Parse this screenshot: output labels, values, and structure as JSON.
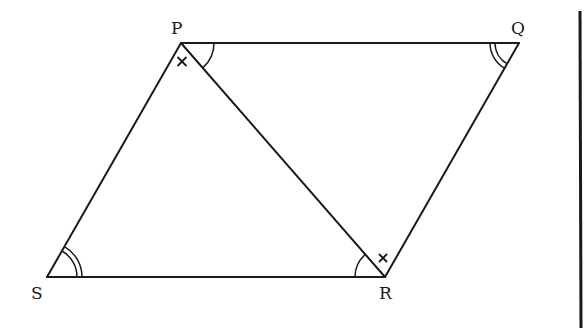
{
  "diagram": {
    "vertices": {
      "P": {
        "label": "P",
        "x": 181,
        "y": 43
      },
      "Q": {
        "label": "Q",
        "x": 519,
        "y": 43
      },
      "R": {
        "label": "R",
        "x": 385,
        "y": 277
      },
      "S": {
        "label": "S",
        "x": 47,
        "y": 277
      }
    },
    "edges": [
      "PQ",
      "QR",
      "RS",
      "SP",
      "PR"
    ],
    "angle_marks": [
      {
        "vertex": "P",
        "between": [
          "PQ",
          "PR"
        ],
        "type": "single-arc"
      },
      {
        "vertex": "P",
        "between": [
          "PS",
          "PR"
        ],
        "type": "cross"
      },
      {
        "vertex": "Q",
        "between": [
          "QP",
          "QR"
        ],
        "type": "double-arc"
      },
      {
        "vertex": "R",
        "between": [
          "RS",
          "RP"
        ],
        "type": "single-arc"
      },
      {
        "vertex": "R",
        "between": [
          "RP",
          "RQ"
        ],
        "type": "cross"
      },
      {
        "vertex": "S",
        "between": [
          "SR",
          "SP"
        ],
        "type": "double-arc"
      }
    ],
    "labels": {
      "P": "P",
      "Q": "Q",
      "R": "R",
      "S": "S"
    },
    "stroke_color": "#1a1a1a",
    "background_color": "#ffffff"
  }
}
